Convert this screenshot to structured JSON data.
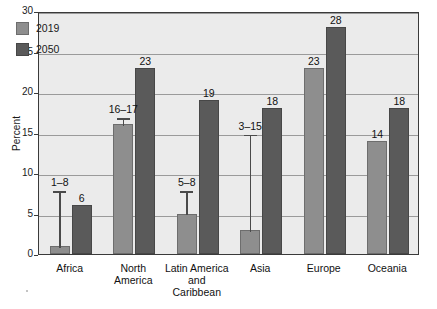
{
  "chart_data": {
    "type": "bar",
    "title": "",
    "subtitle": "",
    "xlabel": "",
    "ylabel": "Percent",
    "ylim": [
      0,
      30
    ],
    "yticks": [
      0,
      5,
      10,
      15,
      20,
      25,
      30
    ],
    "grid": true,
    "legend_position": "top-left",
    "categories": [
      "Africa",
      "North America",
      "Latin America and Caribbean",
      "Asia",
      "Europe",
      "Oceania"
    ],
    "category_lines": [
      [
        "Africa"
      ],
      [
        "North",
        "America"
      ],
      [
        "Latin America",
        "and",
        "Caribbean"
      ],
      [
        "Asia"
      ],
      [
        "Europe"
      ],
      [
        "Oceania"
      ]
    ],
    "series": [
      {
        "name": "2019",
        "color": "#8e8e8e",
        "values": [
          1,
          16,
          5,
          3,
          23,
          14
        ],
        "data_labels": [
          "1–8",
          "16–17",
          "5–8",
          "3–15",
          "23",
          "14"
        ],
        "error_bars": [
          {
            "category": "Africa",
            "low": 1,
            "high": 8
          },
          {
            "category": "North America",
            "low": 16,
            "high": 17
          },
          {
            "category": "Latin America and Caribbean",
            "low": 5,
            "high": 8
          },
          {
            "category": "Asia",
            "low": 3,
            "high": 15
          },
          {
            "category": "Europe",
            "low": null,
            "high": null
          },
          {
            "category": "Oceania",
            "low": null,
            "high": null
          }
        ]
      },
      {
        "name": "2050",
        "color": "#5a5a5a",
        "values": [
          6,
          23,
          19,
          18,
          28,
          18
        ],
        "data_labels": [
          "6",
          "23",
          "19",
          "18",
          "28",
          "18"
        ],
        "error_bars": [
          {
            "category": "Africa",
            "low": null,
            "high": null
          },
          {
            "category": "North America",
            "low": null,
            "high": null
          },
          {
            "category": "Latin America and Caribbean",
            "low": null,
            "high": null
          },
          {
            "category": "Asia",
            "low": null,
            "high": null
          },
          {
            "category": "Europe",
            "low": null,
            "high": null
          },
          {
            "category": "Oceania",
            "low": null,
            "high": null
          }
        ]
      }
    ]
  },
  "legend": {
    "items": [
      {
        "label": "2019",
        "color": "#8e8e8e"
      },
      {
        "label": "2050",
        "color": "#5a5a5a"
      }
    ]
  },
  "axis": {
    "y_title": "Percent",
    "y_tick_labels": [
      "30",
      "25",
      "20",
      "15",
      "10",
      "5",
      "0"
    ]
  },
  "colors": {
    "series_2019": "#8e8e8e",
    "series_2050": "#5a5a5a",
    "plot_background": "#ebebeb",
    "gridline": "#9a9a9a",
    "frame": "#3a3a3a",
    "page_background": "#ffffff"
  }
}
